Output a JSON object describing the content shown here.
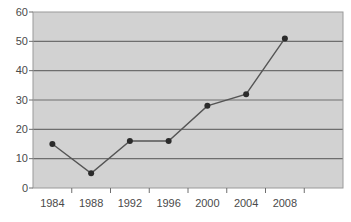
{
  "chart_data": {
    "type": "line",
    "title": "",
    "subtitle": "",
    "xlabel": "",
    "ylabel": "",
    "categories": [
      "1984",
      "1988",
      "1992",
      "1996",
      "2000",
      "2004",
      "2008"
    ],
    "x": [
      1984,
      1988,
      1992,
      1996,
      2000,
      2004,
      2008
    ],
    "values": [
      15,
      5,
      16,
      16,
      28,
      32,
      51
    ],
    "series": [
      {
        "name": "",
        "values": [
          15,
          5,
          16,
          16,
          28,
          32,
          51
        ]
      }
    ],
    "ylim": [
      0,
      60
    ],
    "yticks": [
      0,
      10,
      20,
      30,
      40,
      50,
      60
    ],
    "ytick_labels": [
      "0",
      "10",
      "20",
      "30",
      "40",
      "50",
      "60"
    ],
    "xtick_labels": [
      "1984",
      "1988",
      "1992",
      "1996",
      "2000",
      "2004",
      "2008"
    ],
    "grid": true,
    "grid_axis": "y",
    "legend": false,
    "legend_position": "none",
    "annotations": [],
    "marker": "filled-circle"
  },
  "style": {
    "plot_background": "#d2d2d2",
    "page_background": "#ffffff",
    "grid_color": "#6e6e6e",
    "border_color": "#9a9a9a",
    "line_color": "#555555",
    "marker_color": "#2b2b2b",
    "tick_color": "#6e6e6e",
    "label_color": "#4a4a4a"
  }
}
